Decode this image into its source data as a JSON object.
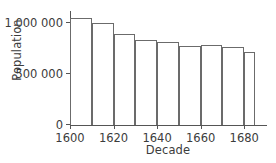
{
  "chart_data": {
    "type": "bar",
    "title": "",
    "xlabel": "Decade",
    "ylabel": "Population",
    "categories": [
      "1600",
      "1610",
      "1620",
      "1630",
      "1640",
      "1650",
      "1660",
      "1670",
      "1680"
    ],
    "values": [
      1050000,
      1000000,
      895000,
      840000,
      815000,
      775000,
      785000,
      770000,
      715000
    ],
    "xlim": [
      1600,
      1690
    ],
    "ylim": [
      0,
      1110000
    ],
    "grid": false,
    "legend": null,
    "bar_fill": "#ffffff",
    "bar_edge_color": "#6b6b6b",
    "axis_color": "#555555",
    "text_color": "#3c3c3c",
    "y_ticks": [
      {
        "value": 0,
        "label": "0"
      },
      {
        "value": 500000,
        "label": "500 000"
      },
      {
        "value": 1000000,
        "label": "1 000 000"
      }
    ],
    "x_ticks": [
      {
        "value": 1600,
        "label": "1600"
      },
      {
        "value": 1620,
        "label": "1620"
      },
      {
        "value": 1640,
        "label": "1640"
      },
      {
        "value": 1660,
        "label": "1660"
      },
      {
        "value": 1680,
        "label": "1680"
      }
    ],
    "bars": [
      {
        "decade": "1600",
        "value": 1050000,
        "x_start": 1600,
        "x_end": 1610
      },
      {
        "decade": "1610",
        "value": 1000000,
        "x_start": 1610,
        "x_end": 1620
      },
      {
        "decade": "1620",
        "value": 895000,
        "x_start": 1620,
        "x_end": 1630
      },
      {
        "decade": "1630",
        "value": 840000,
        "x_start": 1630,
        "x_end": 1640
      },
      {
        "decade": "1640",
        "value": 815000,
        "x_start": 1640,
        "x_end": 1650
      },
      {
        "decade": "1650",
        "value": 775000,
        "x_start": 1650,
        "x_end": 1660
      },
      {
        "decade": "1660",
        "value": 785000,
        "x_start": 1660,
        "x_end": 1670
      },
      {
        "decade": "1670",
        "value": 770000,
        "x_start": 1670,
        "x_end": 1680
      },
      {
        "decade": "1680",
        "value": 715000,
        "x_start": 1680,
        "x_end": 1685
      }
    ]
  }
}
